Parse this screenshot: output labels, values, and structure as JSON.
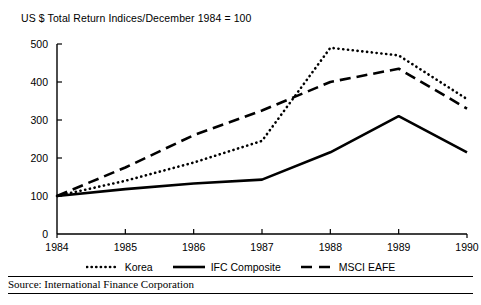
{
  "chart_data": {
    "type": "line",
    "title": "US $ Total Return Indices/December 1984 = 100",
    "xlabel": "",
    "ylabel": "",
    "x": [
      1984,
      1985,
      1986,
      1987,
      1988,
      1989,
      1990
    ],
    "categories": [
      "1984",
      "1985",
      "1986",
      "1987",
      "1988",
      "1989",
      "1990"
    ],
    "xlim": [
      1984,
      1990
    ],
    "ylim": [
      0,
      500
    ],
    "yticks": [
      0,
      100,
      200,
      300,
      400,
      500
    ],
    "ytick_labels": [
      "0",
      "100",
      "200",
      "300",
      "400",
      "500"
    ],
    "grid": false,
    "legend_position": "below",
    "series": [
      {
        "name": "Korea",
        "style": "dotted",
        "values": [
          100,
          140,
          188,
          245,
          490,
          470,
          355
        ]
      },
      {
        "name": "IFC Composite",
        "style": "solid",
        "values": [
          100,
          118,
          133,
          143,
          215,
          310,
          215
        ]
      },
      {
        "name": "MSCI EAFE",
        "style": "dashed",
        "values": [
          100,
          175,
          260,
          325,
          400,
          435,
          330
        ]
      }
    ]
  },
  "legend": {
    "items": [
      {
        "label": "Korea",
        "style": "dotted"
      },
      {
        "label": "IFC Composite",
        "style": "solid"
      },
      {
        "label": "MSCI EAFE",
        "style": "dashed"
      }
    ]
  },
  "source": {
    "text": "Source: International Finance Corporation"
  },
  "colors": {
    "ink": "#000000",
    "background": "#ffffff"
  }
}
